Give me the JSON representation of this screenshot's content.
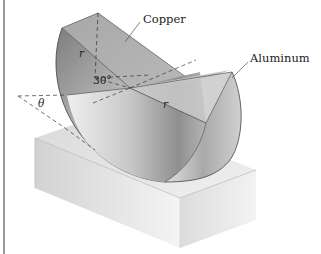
{
  "figure": {
    "labels": {
      "copper": "Copper",
      "aluminum": "Aluminum",
      "angle_30": "30°",
      "theta": "θ",
      "radius_upper": "r",
      "radius_lower": "r"
    },
    "parts": [
      "copper half-cylinder",
      "aluminum half-cylinder",
      "base block"
    ],
    "colors": {
      "border": "#9a9a9a",
      "metal_dark": "#8a8a8a",
      "metal_light": "#f2f2f2",
      "base_top": "#e6e6e6",
      "line": "#333333"
    }
  }
}
